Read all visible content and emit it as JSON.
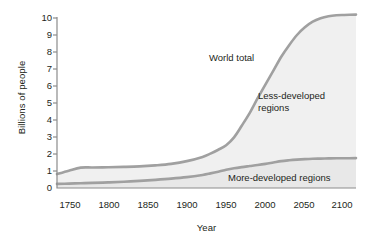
{
  "chart_data": {
    "type": "area",
    "title": "",
    "xlabel": "Year",
    "ylabel": "Billions of people",
    "xlim": [
      1735,
      2115
    ],
    "ylim": [
      0,
      10.6
    ],
    "xticks": [
      "1750",
      "1800",
      "1850",
      "1900",
      "1950",
      "2000",
      "2050",
      "2100"
    ],
    "xtick_values": [
      1750,
      1800,
      1850,
      1900,
      1950,
      2000,
      2050,
      2100
    ],
    "yticks": [
      "0",
      "1",
      "2",
      "3",
      "4",
      "5",
      "6",
      "7",
      "8",
      "9",
      "10"
    ],
    "ytick_values": [
      0,
      1,
      2,
      3,
      4,
      5,
      6,
      7,
      8,
      9,
      10
    ],
    "grid": false,
    "legend_position": "inline-annotations",
    "x": [
      1735,
      1750,
      1765,
      1780,
      1800,
      1820,
      1840,
      1860,
      1880,
      1900,
      1920,
      1930,
      1940,
      1950,
      1960,
      1970,
      1980,
      1990,
      2000,
      2010,
      2020,
      2030,
      2040,
      2050,
      2060,
      2070,
      2080,
      2090,
      2100,
      2115
    ],
    "series": [
      {
        "name": "World total",
        "color": "#a0a0a0",
        "values": [
          0.82,
          1.02,
          1.2,
          1.21,
          1.22,
          1.24,
          1.27,
          1.33,
          1.42,
          1.58,
          1.83,
          2.02,
          2.25,
          2.52,
          2.98,
          3.68,
          4.42,
          5.28,
          6.1,
          6.9,
          7.72,
          8.4,
          9.0,
          9.45,
          9.78,
          9.98,
          10.1,
          10.16,
          10.18,
          10.2
        ]
      },
      {
        "name": "More-developed regions",
        "color": "#a0a0a0",
        "values": [
          0.24,
          0.26,
          0.28,
          0.3,
          0.33,
          0.37,
          0.42,
          0.48,
          0.55,
          0.64,
          0.77,
          0.86,
          0.96,
          1.07,
          1.16,
          1.23,
          1.29,
          1.35,
          1.42,
          1.5,
          1.58,
          1.63,
          1.67,
          1.7,
          1.72,
          1.73,
          1.74,
          1.75,
          1.75,
          1.76
        ]
      }
    ],
    "annotations": [
      {
        "id": "world",
        "text": "World total"
      },
      {
        "id": "less1",
        "text": "Less-developed"
      },
      {
        "id": "less2",
        "text": "regions"
      },
      {
        "id": "more",
        "text": "More-developed regions"
      }
    ],
    "band_fill_upper": "#f0f0f0",
    "band_fill_lower": "#e8e8e8",
    "axis_color": "#8c8c8c"
  }
}
